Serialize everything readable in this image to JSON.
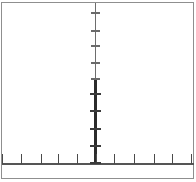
{
  "figure": {
    "title": "",
    "background_color": "#ffffff",
    "frame_color": "#8f8f8f",
    "axis_color": "#555555",
    "tick_color": "#4a4a4a",
    "emphasis_color": "#2b2b2b",
    "width_px": 196,
    "height_px": 182
  },
  "chart_data": {
    "type": "scatter",
    "title": "",
    "subtitle": "",
    "xlabel": "",
    "ylabel": "",
    "grid": false,
    "legend": null,
    "legend_position": "none",
    "axis_style": "crossed-spines",
    "x_axis": {
      "position_px": 163,
      "spine_from_px": 2,
      "spine_to_px": 194,
      "ticks_px": [
        2,
        21,
        41,
        58,
        77,
        96,
        114,
        134,
        154,
        172,
        191
      ],
      "tick_labels": [],
      "tick_direction": "up",
      "tick_length_px": 10,
      "xlim": [
        -5,
        5
      ],
      "tick_values": [
        -5,
        -4,
        -3,
        -2,
        -1,
        0,
        1,
        2,
        3,
        4,
        5
      ]
    },
    "y_axis": {
      "position_px": 96,
      "spine_from_px": 3,
      "spine_to_px": 164,
      "ticks_px": [
        12,
        30,
        45,
        62,
        78,
        93,
        110,
        128,
        145,
        162
      ],
      "tick_labels": [],
      "tick_direction": "both",
      "tick_length_px": 9,
      "ylim": [
        0,
        10
      ],
      "tick_values": [
        10,
        9,
        8,
        7,
        6,
        5,
        4,
        3,
        2,
        1
      ]
    },
    "series": [
      {
        "name": "vertical-cluster",
        "description": "Dense dark vertical segment along the y axis below the midpoint",
        "x": [
          0,
          0,
          0,
          0,
          0,
          0,
          0,
          0,
          0,
          0
        ],
        "y": [
          5.0,
          4.5,
          4.0,
          3.5,
          3.0,
          2.5,
          2.0,
          1.5,
          1.0,
          0.5
        ],
        "color": "#2b2b2b"
      }
    ],
    "annotations": []
  }
}
